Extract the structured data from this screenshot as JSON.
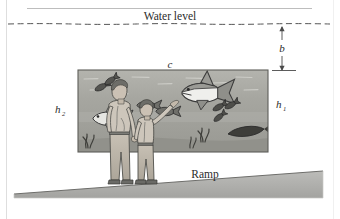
{
  "figure": {
    "title_text": "Water level",
    "ramp_text": "Ramp",
    "labels": {
      "b": "b",
      "c": "c",
      "h1_base": "h",
      "h1_sub": "1",
      "h2_base": "h",
      "h2_sub": "2"
    },
    "icons": {
      "water_line": "dashed-water-level-line",
      "dimension_arrow_b": "double-headed-arrow-icon",
      "tank": "aquarium-tank-rectangle",
      "ramp": "ramp-wedge",
      "shark": "shark-icon",
      "fish_left": "fish-icon",
      "fish_small_group": "small-fish-icon",
      "eel": "eel-icon",
      "seaweed": "seaweed-icon",
      "adult": "adult-person-figure",
      "child": "child-person-figure"
    },
    "colors": {
      "water": "#a9a9a4",
      "water_dark": "#949490",
      "water_light": "#c0c0bb",
      "ramp": "#b0b0ad",
      "ink": "#2b2b2b",
      "border": "#d8d8d8",
      "skin": "#cfc6bb",
      "cloth": "#b9b2a6"
    }
  }
}
